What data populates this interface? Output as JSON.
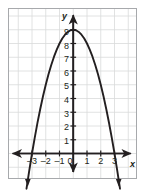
{
  "figure": {
    "kind": "coordinate-plane-graph",
    "background_color": "#ffffff",
    "border_color": "#a7a9ac",
    "grid_color": "#d9dadb",
    "axis_color": "#231f20",
    "curve_color": "#231f20",
    "axis_labels": {
      "x": "x",
      "y": "y"
    }
  },
  "chart_data": {
    "type": "line",
    "title": "",
    "xlabel": "x",
    "ylabel": "y",
    "equation": "y = 9 - x^2",
    "grid": true,
    "legend": "none",
    "xlim": [
      -4.7,
      4.5
    ],
    "ylim": [
      -1.7,
      10.4
    ],
    "xticks": [
      -3,
      -2,
      -1,
      0,
      1,
      2,
      3
    ],
    "xtick_labels": [
      "–3",
      "–2",
      "–1",
      "0",
      "1",
      "2",
      "3"
    ],
    "yticks": [
      1,
      2,
      3,
      4,
      5,
      6,
      7,
      8,
      9
    ],
    "ytick_labels": [
      "1",
      "2",
      "3",
      "4",
      "5",
      "6",
      "7",
      "8",
      "9"
    ],
    "vertex": [
      0,
      9
    ],
    "x_intercepts": [
      -3,
      3
    ],
    "y_intercept": 9,
    "x": [
      -3.4,
      -3.2,
      -3.0,
      -2.8,
      -2.6,
      -2.4,
      -2.2,
      -2.0,
      -1.8,
      -1.6,
      -1.4,
      -1.2,
      -1.0,
      -0.8,
      -0.6,
      -0.4,
      -0.2,
      0.0,
      0.2,
      0.4,
      0.6,
      0.8,
      1.0,
      1.2,
      1.4,
      1.6,
      1.8,
      2.0,
      2.2,
      2.4,
      2.6,
      2.8,
      3.0,
      3.2,
      3.4
    ],
    "y": [
      -2.56,
      -1.24,
      0.0,
      1.16,
      2.24,
      3.24,
      4.16,
      5.0,
      5.76,
      6.44,
      7.04,
      7.56,
      8.0,
      8.36,
      8.64,
      8.84,
      8.96,
      9.0,
      8.96,
      8.84,
      8.64,
      8.36,
      8.0,
      7.56,
      7.04,
      6.44,
      5.76,
      5.0,
      4.16,
      3.24,
      2.24,
      1.16,
      0.0,
      -1.24,
      -2.56
    ]
  }
}
